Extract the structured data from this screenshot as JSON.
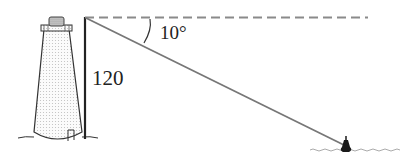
{
  "diagram": {
    "type": "angle-of-depression",
    "labels": {
      "height": "120",
      "angle": "10°"
    },
    "elements": {
      "lighthouse": "lighthouse-icon",
      "buoy": "buoy-icon",
      "water": "water-waves"
    },
    "colors": {
      "line": "#555555",
      "dashed": "#888888",
      "vertical": "#222222",
      "buoy": "#1a1a1a"
    }
  }
}
